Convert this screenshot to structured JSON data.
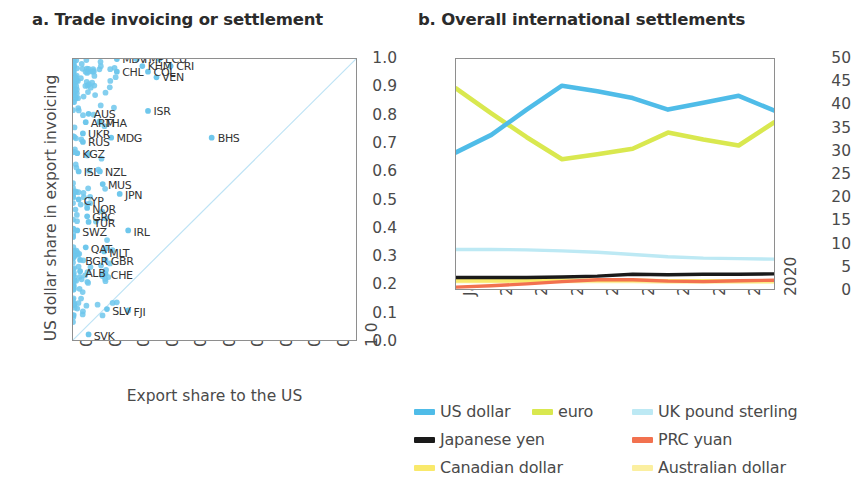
{
  "panel_a": {
    "title": "a. Trade invoicing or settlement",
    "ylabel": "US dollar share in export invoicing",
    "xlabel": "Export share to the US",
    "yticks": [
      "1.0",
      "0.9",
      "0.8",
      "0.7",
      "0.6",
      "0.5",
      "0.4",
      "0.3",
      "0.2",
      "0.1",
      "0.0"
    ],
    "xticks": [
      "0.0",
      "0.1",
      "0.2",
      "0.3",
      "0.4",
      "0.5",
      "0.6",
      "0.7",
      "0.8",
      "0.9",
      "1.0"
    ]
  },
  "panel_b": {
    "title": "b. Overall international settlements",
    "yticks": [
      "50",
      "45",
      "40",
      "35",
      "30",
      "25",
      "20",
      "15",
      "10",
      "5",
      "0"
    ],
    "xticks": [
      "Jan 2012",
      "2012",
      "2013",
      "2014",
      "2015",
      "2016",
      "2017",
      "2018",
      "2019",
      "2020"
    ],
    "legend": [
      {
        "label": "US dollar",
        "color": "#4FBCE8"
      },
      {
        "label": "euro",
        "color": "#D9E84F"
      },
      {
        "label": "UK pound sterling",
        "color": "#BDE9F4"
      },
      {
        "label": "Japanese yen",
        "color": "#1A1A1A"
      },
      {
        "label": "PRC yuan",
        "color": "#F2714F"
      },
      {
        "label": "Canadian dollar",
        "color": "#F9E96B"
      },
      {
        "label": "Australian dollar",
        "color": "#FBEFA0"
      }
    ]
  },
  "chart_data": [
    {
      "type": "scatter",
      "title": "a. Trade invoicing or settlement",
      "xlabel": "Export share to the US",
      "ylabel": "US dollar share in export invoicing",
      "xlim": [
        0.0,
        1.0
      ],
      "ylim": [
        0.0,
        1.0
      ],
      "grid": false,
      "annotation": "45-degree diagonal reference line from (0,0) to (1,1)",
      "point_color": "#6FC7EC",
      "labeled_points": [
        {
          "label": "MDV",
          "x": 0.155,
          "y": 1.0
        },
        {
          "label": "TMP",
          "x": 0.225,
          "y": 1.0
        },
        {
          "label": "ECU",
          "x": 0.305,
          "y": 1.0
        },
        {
          "label": "KHM",
          "x": 0.245,
          "y": 0.975
        },
        {
          "label": "CRI",
          "x": 0.345,
          "y": 0.975
        },
        {
          "label": "COL",
          "x": 0.265,
          "y": 0.955
        },
        {
          "label": "VEN",
          "x": 0.295,
          "y": 0.935
        },
        {
          "label": "CHL",
          "x": 0.155,
          "y": 0.955
        },
        {
          "label": "ISR",
          "x": 0.265,
          "y": 0.815
        },
        {
          "label": "AUS",
          "x": 0.055,
          "y": 0.805
        },
        {
          "label": "ARM",
          "x": 0.045,
          "y": 0.775
        },
        {
          "label": "THA",
          "x": 0.095,
          "y": 0.775
        },
        {
          "label": "UKR",
          "x": 0.035,
          "y": 0.735
        },
        {
          "label": "RUS",
          "x": 0.035,
          "y": 0.705
        },
        {
          "label": "MDG",
          "x": 0.135,
          "y": 0.72
        },
        {
          "label": "BHS",
          "x": 0.49,
          "y": 0.72
        },
        {
          "label": "KGZ",
          "x": 0.015,
          "y": 0.665
        },
        {
          "label": "ISL",
          "x": 0.02,
          "y": 0.6
        },
        {
          "label": "NZL",
          "x": 0.095,
          "y": 0.6
        },
        {
          "label": "MUS",
          "x": 0.105,
          "y": 0.555
        },
        {
          "label": "JPN",
          "x": 0.165,
          "y": 0.52
        },
        {
          "label": "CYP",
          "x": 0.02,
          "y": 0.5
        },
        {
          "label": "NOR",
          "x": 0.05,
          "y": 0.47
        },
        {
          "label": "GRC",
          "x": 0.05,
          "y": 0.44
        },
        {
          "label": "TUR",
          "x": 0.055,
          "y": 0.42
        },
        {
          "label": "SWZ",
          "x": 0.015,
          "y": 0.39
        },
        {
          "label": "IRL",
          "x": 0.195,
          "y": 0.39
        },
        {
          "label": "QAT",
          "x": 0.045,
          "y": 0.33
        },
        {
          "label": "MLT",
          "x": 0.11,
          "y": 0.315
        },
        {
          "label": "BGR",
          "x": 0.025,
          "y": 0.285
        },
        {
          "label": "GBR",
          "x": 0.115,
          "y": 0.285
        },
        {
          "label": "ALB",
          "x": 0.025,
          "y": 0.245
        },
        {
          "label": "CHE",
          "x": 0.115,
          "y": 0.235
        },
        {
          "label": "FJI",
          "x": 0.195,
          "y": 0.105
        },
        {
          "label": "SLV",
          "x": 0.12,
          "y": 0.11
        },
        {
          "label": "SVK",
          "x": 0.055,
          "y": 0.02
        }
      ],
      "unlabeled_points_note": "Dense cloud of ~200 light-blue points concentrated along the left edge (export share to the US < 0.1) spanning the full 0.0-1.0 range of US dollar invoicing share."
    },
    {
      "type": "line",
      "title": "b. Overall international settlements",
      "xlabel": "",
      "ylabel": "",
      "x": [
        "Jan 2012",
        "2012",
        "2013",
        "2014",
        "2015",
        "2016",
        "2017",
        "2018",
        "2019",
        "2020"
      ],
      "ylim": [
        0,
        50
      ],
      "yticks": [
        0,
        5,
        10,
        15,
        20,
        25,
        30,
        35,
        40,
        45,
        50
      ],
      "grid": false,
      "legend_position": "below",
      "series": [
        {
          "name": "US dollar",
          "color": "#4FBCE8",
          "values": [
            29.7,
            33.5,
            39.0,
            44.2,
            43.0,
            41.5,
            39.0,
            40.5,
            42.0,
            38.8
          ]
        },
        {
          "name": "euro",
          "color": "#D9E84F",
          "values": [
            43.6,
            38.2,
            33.0,
            28.2,
            29.3,
            30.5,
            34.0,
            32.5,
            31.2,
            36.2
          ]
        },
        {
          "name": "UK pound sterling",
          "color": "#BDE9F4",
          "values": [
            8.6,
            8.6,
            8.5,
            8.3,
            8.0,
            7.5,
            7.0,
            6.7,
            6.6,
            6.5
          ]
        },
        {
          "name": "Japanese yen",
          "color": "#1A1A1A",
          "values": [
            2.5,
            2.5,
            2.5,
            2.6,
            2.8,
            3.2,
            3.1,
            3.2,
            3.2,
            3.3
          ]
        },
        {
          "name": "PRC yuan",
          "color": "#F2714F",
          "values": [
            0.4,
            0.7,
            1.1,
            1.6,
            2.0,
            2.0,
            1.7,
            1.6,
            1.8,
            1.9
          ]
        },
        {
          "name": "Canadian dollar",
          "color": "#F9E96B",
          "values": [
            1.8,
            1.8,
            1.8,
            1.9,
            1.9,
            1.9,
            1.8,
            1.8,
            1.8,
            1.8
          ]
        },
        {
          "name": "Australian dollar",
          "color": "#FBEFA0",
          "values": [
            1.6,
            1.6,
            1.6,
            1.6,
            1.6,
            1.6,
            1.5,
            1.5,
            1.5,
            1.5
          ]
        }
      ]
    }
  ]
}
